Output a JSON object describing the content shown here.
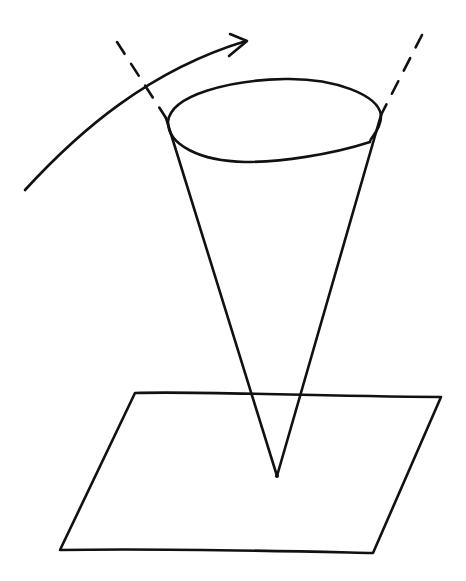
{
  "diagram": {
    "stroke_color": "#111111",
    "background_color": "#ffffff",
    "elements": [
      {
        "name": "rotation-arrow",
        "type": "curved-arrow",
        "direction": "left-to-right, upward"
      },
      {
        "name": "cone",
        "type": "inverted-cone",
        "apex": "touching plane"
      },
      {
        "name": "cone-rim",
        "type": "ellipse"
      },
      {
        "name": "left-axis-extension",
        "type": "dashed-line"
      },
      {
        "name": "right-axis-extension",
        "type": "dashed-line"
      },
      {
        "name": "ground-plane",
        "type": "parallelogram"
      }
    ]
  }
}
